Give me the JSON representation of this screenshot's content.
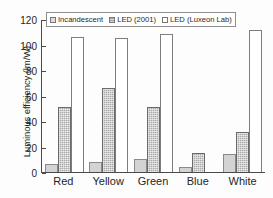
{
  "chart_data": {
    "type": "bar",
    "title": "",
    "xlabel": "",
    "ylabel": "Luminous efficiency (lm/W)",
    "ylim": [
      0,
      120
    ],
    "yticks": [
      0,
      20,
      40,
      60,
      80,
      100,
      120
    ],
    "grid": false,
    "legend_position": "top-left inside plot",
    "categories": [
      "Red",
      "Yellow",
      "Green",
      "Blue",
      "White"
    ],
    "series": [
      {
        "name": "Incandescent",
        "values": [
          6,
          8,
          10,
          4,
          14
        ],
        "fill": "#d3d3d3"
      },
      {
        "name": "LED (2001)",
        "values": [
          51,
          66,
          51,
          15,
          31
        ],
        "fill": "#a8a8a8"
      },
      {
        "name": "LED (Luxeon Lab)",
        "values": [
          106,
          105,
          108,
          null,
          111
        ],
        "fill": "#ffffff"
      }
    ]
  },
  "axis": {
    "y_title": "Luminous efficiency (lm/W)",
    "y_tick_labels": [
      "0",
      "20",
      "40",
      "60",
      "80",
      "100",
      "120"
    ]
  },
  "legend": {
    "entries": [
      {
        "label": "Incandescent"
      },
      {
        "label": "LED (2001)"
      },
      {
        "label": "LED (Luxeon Lab)"
      }
    ]
  }
}
